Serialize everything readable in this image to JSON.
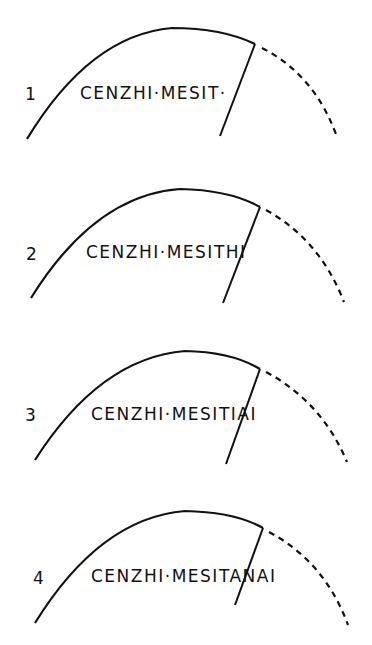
{
  "figure": {
    "stroke_color": "#111111",
    "panels": [
      {
        "label": "1",
        "inscription": "CENZHI·MESIT·"
      },
      {
        "label": "2",
        "inscription": "CENZHI·MESITHI"
      },
      {
        "label": "3",
        "inscription": "CENZHI·MESITIAI"
      },
      {
        "label": "4",
        "inscription": "CENZHI·MESITANAI"
      }
    ]
  }
}
